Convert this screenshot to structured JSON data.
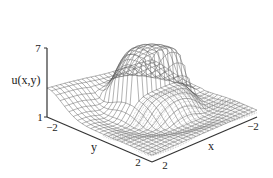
{
  "chart_data": {
    "type": "surface-3d-wireframe",
    "title": "",
    "xlabel": "x",
    "ylabel": "y",
    "zlabel": "u(x,y)",
    "x_range": [
      -2,
      2
    ],
    "y_range": [
      -2,
      2
    ],
    "z_range": [
      1,
      7
    ],
    "x_ticks": [
      "2",
      "-2"
    ],
    "y_ticks": [
      "-2",
      "2"
    ],
    "z_ticks": [
      "7",
      "1"
    ],
    "grid": false,
    "legend": "none",
    "colors": {
      "mesh": "#555555",
      "axes": "#333333",
      "text": "#222222"
    }
  }
}
